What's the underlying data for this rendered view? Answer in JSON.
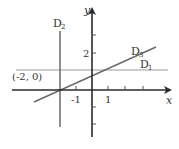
{
  "diagram": {
    "axes": {
      "x_label": "x",
      "y_label": "y"
    },
    "ticks": {
      "x": [
        "-1",
        "1"
      ],
      "y": [
        "2"
      ]
    },
    "lines": [
      {
        "name": "D1",
        "label": "D",
        "sub": "1",
        "kind": "horizontal"
      },
      {
        "name": "D2",
        "label": "D",
        "sub": "2",
        "kind": "vertical"
      },
      {
        "name": "D3",
        "label": "D",
        "sub": "3",
        "kind": "oblique"
      }
    ],
    "point_label": "(-2, 0)",
    "colors": {
      "axis": "#2a2a2a",
      "line": "#6a6a6a",
      "line_light": "#9a9a9a",
      "text": "#333333"
    }
  }
}
